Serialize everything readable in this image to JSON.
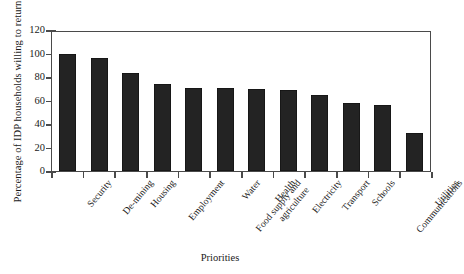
{
  "chart_data": {
    "type": "bar",
    "title": "",
    "xlabel": "Priorities",
    "ylabel": "Percentage of IDP households willing to return",
    "categories": [
      "Security",
      "De-mining",
      "Housing",
      "Employment",
      "Food supply and agriculture",
      "Water",
      "Health",
      "Electricity",
      "Transport",
      "Schools",
      "Communications",
      "Utilities"
    ],
    "values": [
      100,
      96,
      83,
      74,
      71,
      71,
      70,
      69,
      65,
      58,
      56,
      32
    ],
    "ylim": [
      0,
      120
    ],
    "yticks": [
      0,
      20,
      40,
      60,
      80,
      100,
      120
    ],
    "ytick_labels": [
      "0",
      "20",
      "40",
      "60",
      "80",
      "100",
      "120"
    ],
    "grid": false,
    "legend": null,
    "bar_color": "#232323",
    "axis_color": "#4a4a4a",
    "background_color": "#ffffff"
  }
}
